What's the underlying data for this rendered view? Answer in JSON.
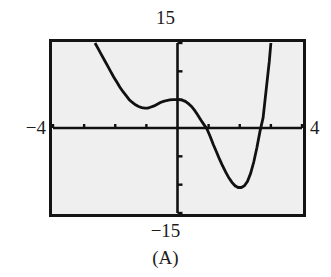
{
  "figure": {
    "caption": "(A)",
    "screen": {
      "frame_color": "#141414",
      "background_color": "#efefef",
      "curve_color": "#111111",
      "axis_color": "#111111",
      "frame_px": {
        "x": 49,
        "y": 39,
        "width": 257,
        "height": 178
      }
    },
    "labels": {
      "y_max": "15",
      "y_min": "−15",
      "x_min": "−4",
      "x_max": "4"
    }
  },
  "chart_data": {
    "type": "line",
    "title": "",
    "subtitle": "",
    "xlabel": "",
    "ylabel": "",
    "xlim": [
      -4,
      4
    ],
    "ylim": [
      -15,
      15
    ],
    "grid": false,
    "legend": null,
    "axes": {
      "x_axis_visible": true,
      "y_axis_visible": true,
      "x_tick_interval": 1,
      "y_tick_interval": 5,
      "x_ticks": [
        -4,
        -3,
        -2,
        -1,
        0,
        1,
        2,
        3,
        4
      ],
      "y_ticks": [
        -15,
        -10,
        -5,
        0,
        5,
        10,
        15
      ],
      "tick_labels_shown": false
    },
    "window_labels": {
      "Xmin": -4,
      "Xmax": 4,
      "Ymin": -15,
      "Ymax": 15
    },
    "series": [
      {
        "name": "curve",
        "style": "solid",
        "color": "#111111",
        "description": "Quartic-like polynomial: falls from top-left, local minimum near x=-1.0, local maximum near x=0.05, falls through a zero near x=0.9, local minimum near x=2.0, rises steeply through a zero near x=2.75",
        "features": {
          "local_minimum_left": {
            "x": -0.95,
            "y": 3.5
          },
          "local_maximum": {
            "x": 0.05,
            "y": 5.0
          },
          "local_minimum_right": {
            "x": 2.0,
            "y": -10.5
          },
          "x_intercepts": [
            0.93,
            2.75
          ],
          "y_intercept": 5.0
        },
        "x": [
          -2.65,
          -2.55,
          -2.45,
          -2.35,
          -2.25,
          -2.15,
          -2.05,
          -1.95,
          -1.85,
          -1.75,
          -1.65,
          -1.55,
          -1.45,
          -1.35,
          -1.25,
          -1.15,
          -1.05,
          -0.95,
          -0.85,
          -0.75,
          -0.65,
          -0.55,
          -0.45,
          -0.35,
          -0.25,
          -0.15,
          -0.05,
          0.05,
          0.15,
          0.25,
          0.35,
          0.45,
          0.55,
          0.65,
          0.75,
          0.85,
          0.95,
          1.05,
          1.15,
          1.25,
          1.35,
          1.45,
          1.55,
          1.65,
          1.75,
          1.85,
          1.95,
          2.05,
          2.15,
          2.25,
          2.35,
          2.45,
          2.55,
          2.65,
          2.75,
          2.85,
          2.95,
          3.0
        ],
        "y": [
          15.0,
          14.0,
          13.0,
          12.0,
          11.0,
          10.0,
          9.0,
          8.1,
          7.2,
          6.4,
          5.7,
          5.0,
          4.5,
          4.1,
          3.8,
          3.6,
          3.5,
          3.5,
          3.7,
          3.9,
          4.2,
          4.5,
          4.7,
          4.85,
          4.95,
          5.0,
          5.0,
          5.0,
          4.9,
          4.7,
          4.3,
          3.8,
          3.1,
          2.3,
          1.4,
          0.6,
          -0.2,
          -1.5,
          -2.9,
          -4.2,
          -5.5,
          -6.7,
          -7.8,
          -8.8,
          -9.6,
          -10.2,
          -10.5,
          -10.5,
          -10.2,
          -9.4,
          -8.0,
          -6.0,
          -3.5,
          -0.6,
          1.8,
          6.8,
          11.8,
          15.0
        ]
      }
    ]
  }
}
